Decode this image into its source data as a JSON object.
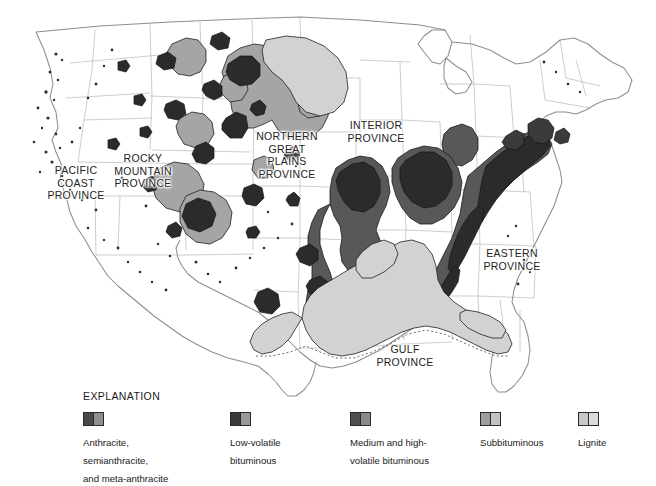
{
  "figure": {
    "background_color": "#ffffff",
    "outline_color": "#8c8c8c",
    "state_line_color": "#b4b4b4",
    "coal_outline_color": "#1e1e1e"
  },
  "provinces": [
    {
      "id": "pacific-coast",
      "label": "PACIFIC\nCOAST\nPROVINCE"
    },
    {
      "id": "rocky-mountain",
      "label": "ROCKY\nMOUNTAIN\nPROVINCE"
    },
    {
      "id": "northern-great-plains",
      "label": "NORTHERN\nGREAT\nPLAINS\nPROVINCE"
    },
    {
      "id": "interior",
      "label": "INTERIOR\nPROVINCE"
    },
    {
      "id": "eastern",
      "label": "EASTERN\nPROVINCE"
    },
    {
      "id": "gulf",
      "label": "GULF\nPROVINCE"
    }
  ],
  "legend": {
    "title": "EXPLANATION",
    "items": [
      {
        "label": "Anthracite,\nsemianthracite,\nand meta-anthracite",
        "rank": "anthracite",
        "swatch_left": "#4a4a4a",
        "swatch_right": "#8f8f8f"
      },
      {
        "label": "Low-volatile\nbituminous",
        "rank": "low-volatile-bituminous",
        "swatch_left": "#3a3a3a",
        "swatch_right": "#9a9a9a"
      },
      {
        "label": "Medium and high-\nvolatile bituminous",
        "rank": "medium-high-volatile-bituminous",
        "swatch_left": "#4f4f4f",
        "swatch_right": "#8a8a8a"
      },
      {
        "label": "Subbituminous",
        "rank": "subbituminous",
        "swatch_left": "#9d9d9d",
        "swatch_right": "#c2c2c2"
      },
      {
        "label": "Lignite",
        "rank": "lignite",
        "swatch_left": "#c8c8c8",
        "swatch_right": "#dcdcdc"
      }
    ]
  },
  "map_fills": {
    "anthracite": "#3f3f3f",
    "low_volatile_bituminous": "#2e2e2e",
    "medium_high_volatile_bituminous": "#575757",
    "subbituminous": "#a3a3a3",
    "lignite": "#cfcfcf"
  }
}
